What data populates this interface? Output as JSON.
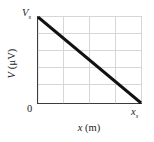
{
  "figure": {
    "name": "potential-vs-position-graph",
    "background_color": "#ffffff"
  },
  "axes": {
    "y_axis_title": "V (μV)",
    "y_axis_title_symbol": "V",
    "y_axis_title_unit": "(μV)",
    "x_axis_title": "x (m)",
    "x_axis_title_symbol": "x",
    "x_axis_title_unit": "(m)",
    "origin_label": "0",
    "y_max_label_symbol": "V",
    "y_max_label_subscript": "s",
    "y_max_label": "Vs",
    "x_max_label_symbol": "x",
    "x_max_label_subscript": "s",
    "x_max_label": "xs",
    "axis_color": "#3c3c3c",
    "grid_color": "#d6d6d6",
    "grid_visible": true,
    "x_gridline_count": 3,
    "y_gridline_count": 5,
    "tick_color": "#707070"
  },
  "chart_data": {
    "type": "line",
    "title": "",
    "subtitle": "",
    "xlabel": "x (m)",
    "ylabel": "V (μV)",
    "xlim": [
      0,
      1
    ],
    "ylim": [
      0,
      1
    ],
    "xtick_labels": [
      "0",
      "",
      "",
      "",
      "xs"
    ],
    "ytick_labels": [
      "0",
      "",
      "",
      "",
      "",
      "Vs"
    ],
    "grid": true,
    "legend": "none",
    "annotations": [
      "V decreases linearly from Vs at x = 0 to 0 at x = xs"
    ],
    "series": [
      {
        "name": "potential",
        "color": "#111111",
        "linewidth": 3,
        "x": [
          0,
          1
        ],
        "y": [
          1,
          0
        ]
      }
    ]
  }
}
